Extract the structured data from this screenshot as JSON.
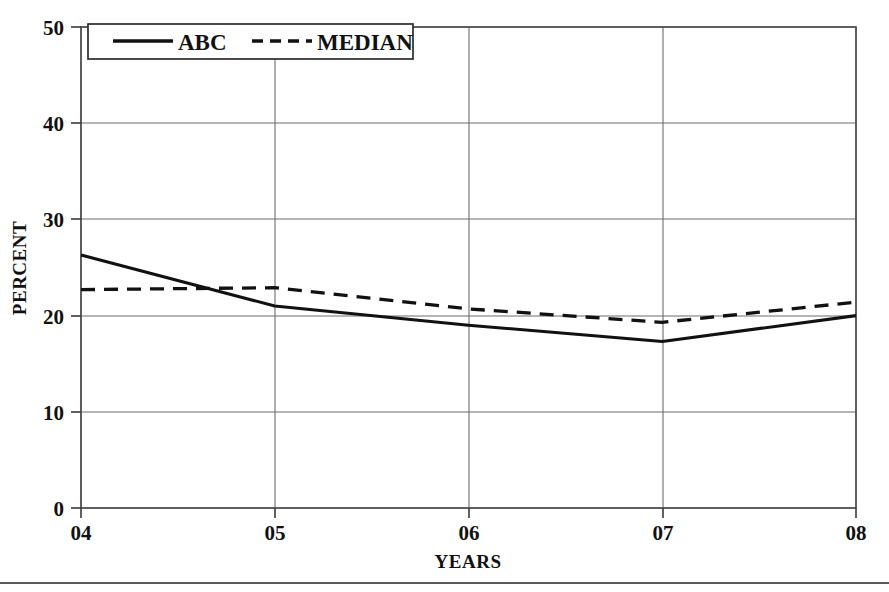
{
  "chart_data": {
    "type": "line",
    "title": "",
    "xlabel": "YEARS",
    "ylabel": "PERCENT",
    "x": [
      "04",
      "05",
      "06",
      "07",
      "08"
    ],
    "categories": [
      "04",
      "05",
      "06",
      "07",
      "08"
    ],
    "xlim": [
      0,
      4
    ],
    "ylim": [
      0,
      50
    ],
    "yticks": [
      0,
      10,
      20,
      30,
      40,
      50
    ],
    "ytick_labels": [
      "0",
      "10",
      "20",
      "30",
      "40",
      "50"
    ],
    "xtick_labels": [
      "04",
      "05",
      "06",
      "07",
      "08"
    ],
    "grid": true,
    "grid_axes": "both",
    "legend_position": "top-left-inside",
    "series": [
      {
        "name": "ABC",
        "style": "solid",
        "color": "#111111",
        "values": [
          26.3,
          21.0,
          19.0,
          17.3,
          20.0
        ]
      },
      {
        "name": "MEDIAN",
        "style": "dashed",
        "color": "#111111",
        "values": [
          22.7,
          22.9,
          20.7,
          19.3,
          21.4
        ]
      }
    ]
  },
  "axes": {
    "y_title": "PERCENT",
    "x_title": "YEARS",
    "y_ticks": [
      {
        "label": "50",
        "value": 50
      },
      {
        "label": "40",
        "value": 40
      },
      {
        "label": "30",
        "value": 30
      },
      {
        "label": "20",
        "value": 20
      },
      {
        "label": "10",
        "value": 10
      },
      {
        "label": "0",
        "value": 0
      }
    ],
    "x_ticks": [
      {
        "label": "04",
        "value": 0
      },
      {
        "label": "05",
        "value": 1
      },
      {
        "label": "06",
        "value": 2
      },
      {
        "label": "07",
        "value": 3
      },
      {
        "label": "08",
        "value": 4
      }
    ]
  },
  "legend": {
    "entries": [
      {
        "label": "ABC",
        "style": "solid"
      },
      {
        "label": "MEDIAN",
        "style": "dashed"
      }
    ]
  },
  "colors": {
    "line": "#111111",
    "grid": "#6c6c6c",
    "frame": "#4a4a4a",
    "background": "#ffffff"
  }
}
